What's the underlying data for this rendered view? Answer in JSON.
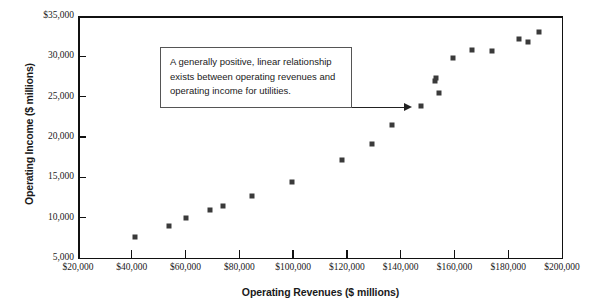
{
  "chart_data": {
    "type": "scatter",
    "title": "",
    "xlabel": "Operating Revenues ($ millions)",
    "ylabel": "Operating Income ($ millions)",
    "xlim": [
      20000,
      200000
    ],
    "ylim": [
      5000,
      35000
    ],
    "xticks": [
      20000,
      40000,
      60000,
      80000,
      100000,
      120000,
      140000,
      160000,
      180000,
      200000
    ],
    "yticks": [
      5000,
      10000,
      15000,
      20000,
      25000,
      30000,
      35000
    ],
    "xticklabels": [
      "$20,000",
      "$40,000",
      "$60,000",
      "$80,000",
      "$100,000",
      "$120,000",
      "$140,000",
      "$160,000",
      "$180,000",
      "$200,000"
    ],
    "yticklabels": [
      "5,000",
      "10,000",
      "15,000",
      "20,000",
      "25,000",
      "30,000",
      "$35,000"
    ],
    "grid": false,
    "legend": null,
    "marker": "square",
    "marker_color": "#3a3a3a",
    "points": [
      {
        "x": 53700,
        "y": 9000
      },
      {
        "x": 41300,
        "y": 7600
      },
      {
        "x": 60100,
        "y": 10000
      },
      {
        "x": 69100,
        "y": 11000
      },
      {
        "x": 74000,
        "y": 11400
      },
      {
        "x": 84800,
        "y": 12700
      },
      {
        "x": 99600,
        "y": 14400
      },
      {
        "x": 118000,
        "y": 17100
      },
      {
        "x": 129300,
        "y": 19100
      },
      {
        "x": 136700,
        "y": 21500
      },
      {
        "x": 147700,
        "y": 23900
      },
      {
        "x": 153100,
        "y": 27300
      },
      {
        "x": 152700,
        "y": 26900
      },
      {
        "x": 154400,
        "y": 25400
      },
      {
        "x": 159500,
        "y": 29800
      },
      {
        "x": 166400,
        "y": 30800
      },
      {
        "x": 173900,
        "y": 30700
      },
      {
        "x": 183900,
        "y": 32200
      },
      {
        "x": 187500,
        "y": 31800
      },
      {
        "x": 191500,
        "y": 33000
      }
    ],
    "annotation": {
      "lines": [
        "A generally positive, linear relationship",
        "exists between operating revenues and",
        "operating income for utilities."
      ],
      "arrow": "points-right"
    }
  }
}
